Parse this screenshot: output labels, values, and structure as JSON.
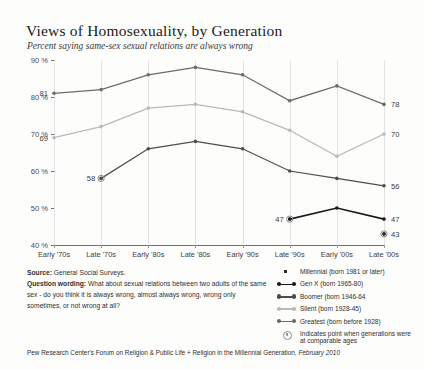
{
  "header": {
    "title": "Views of Homosexuality, by Generation",
    "subtitle": "Percent saying same-sex sexual relations are always wrong"
  },
  "notes": {
    "source_label": "Source:",
    "source_value": "General Social Surveys.",
    "question_label": "Question wording:",
    "question_value": "What about sexual relations between two adults of the same sex - do you think it is always wrong, almost always wrong, wrong only sometimes, or not wrong at all?"
  },
  "footer": {
    "text": "Pew Research Center's Forum on Religion & Public Life + Religion in the Millennial Generation,",
    "date": "February 2010"
  },
  "legend": {
    "items": [
      {
        "label": "Millennial (born 1981 or later)",
        "key": "single-point",
        "color": "#2b2b2b"
      },
      {
        "label": "Gen X (born 1965-80)",
        "key": "line-dots",
        "color": "#1a1a1a"
      },
      {
        "label": "Boomer (born 1946-64",
        "key": "line-dots",
        "color": "#4d4d4d"
      },
      {
        "label": "Silent (born 1928-45)",
        "key": "line-dots",
        "color": "#b9b9b9"
      },
      {
        "label": "Greatest (born before 1928)",
        "key": "line-dots",
        "color": "#6b6b6b"
      },
      {
        "label": "Indicates point when generations were at comparable ages",
        "key": "ring",
        "color": "#8a8a8a"
      }
    ]
  },
  "chart_data": {
    "type": "line",
    "title": "Views of Homosexuality, by Generation",
    "subtitle": "Percent saying same-sex sexual relations are always wrong",
    "xlabel": "",
    "ylabel": "",
    "ylim": [
      40,
      90
    ],
    "yticks": [
      40,
      50,
      60,
      70,
      80,
      90
    ],
    "ytick_labels": [
      "40 %",
      "50 %",
      "60 %",
      "70 %",
      "80 %",
      "90 %"
    ],
    "grid": "vertical",
    "legend_position": "bottom-right",
    "categories": [
      "Early '70s",
      "Late '70s",
      "Early '80s",
      "Late '80s",
      "Early '90s",
      "Late '90s",
      "Early '00s",
      "Late '00s"
    ],
    "series": [
      {
        "name": "Greatest (born before 1928)",
        "color": "#6b6b6b",
        "values": [
          81,
          82,
          86,
          88,
          86,
          79,
          83,
          78
        ],
        "start_label": "81",
        "end_label": "78",
        "comparable_age_index": null
      },
      {
        "name": "Silent (born 1928-45)",
        "color": "#b9b9b9",
        "values": [
          69,
          72,
          77,
          78,
          76,
          71,
          64,
          70
        ],
        "start_label": "69",
        "end_label": "70",
        "comparable_age_index": null
      },
      {
        "name": "Boomer (born 1946-64",
        "color": "#4d4d4d",
        "values": [
          null,
          58,
          66,
          68,
          66,
          60,
          58,
          56
        ],
        "start_label": "58",
        "end_label": "56",
        "comparable_age_index": 1
      },
      {
        "name": "Gen X (born 1965-80)",
        "color": "#1a1a1a",
        "values": [
          null,
          null,
          null,
          null,
          null,
          47,
          50,
          47
        ],
        "start_label": "47",
        "end_label": "47",
        "comparable_age_index": 5
      },
      {
        "name": "Millennial (born 1981 or later)",
        "color": "#2b2b2b",
        "values": [
          null,
          null,
          null,
          null,
          null,
          null,
          null,
          43
        ],
        "start_label": null,
        "end_label": "43",
        "comparable_age_index": 7
      }
    ]
  }
}
